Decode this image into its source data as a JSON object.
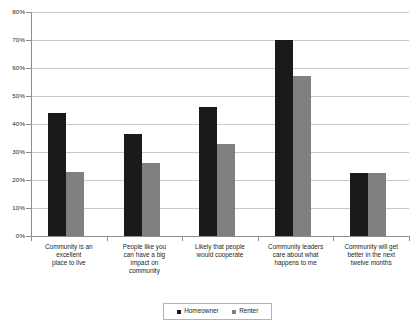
{
  "chart_data": {
    "type": "bar",
    "title": "",
    "subtitle": "",
    "xlabel": "",
    "ylabel": "",
    "ylim": [
      0,
      80
    ],
    "y_unit": "%",
    "y_ticks": [
      "0%",
      "10%",
      "20%",
      "30%",
      "40%",
      "50%",
      "60%",
      "70%",
      "80%"
    ],
    "y_tick_values": [
      0,
      10,
      20,
      30,
      40,
      50,
      60,
      70,
      80
    ],
    "grid": true,
    "legend_position": "bottom",
    "categories": [
      "Community is an excellent place to live",
      "People like you can have a big impact on community",
      "Likely that people would cooperate",
      "Community leaders care about what happens to me",
      "Community will get better in the next twelve months"
    ],
    "category_lines": [
      [
        "Community is an",
        "excellent",
        "place to live"
      ],
      [
        "People like you",
        "can have a big",
        "impact on",
        "community"
      ],
      [
        "Likely that people",
        "would cooperate"
      ],
      [
        "Community leaders",
        "care about what",
        "happens to me"
      ],
      [
        "Community will get",
        "better in the next",
        "twelve months"
      ]
    ],
    "series": [
      {
        "name": "Homeowner",
        "color": "#1a1a1a",
        "values": [
          44,
          36.5,
          46,
          70,
          22.5
        ]
      },
      {
        "name": "Renter",
        "color": "#808080",
        "values": [
          23,
          26,
          33,
          57,
          22.5
        ]
      }
    ]
  },
  "legend": {
    "items": [
      {
        "label": "Homeowner",
        "color": "#1a1a1a"
      },
      {
        "label": "Renter",
        "color": "#808080"
      }
    ]
  }
}
